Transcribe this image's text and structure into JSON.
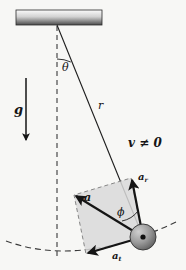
{
  "figure": {
    "labels": {
      "gravity": "g",
      "angle_theta": "θ",
      "radius": "r",
      "velocity_note": "v ≠ 0",
      "accel_radial": "a",
      "accel_radial_sub": "r",
      "accel_total": "a",
      "angle_phi": "ϕ",
      "accel_tangential": "a",
      "accel_tangential_sub": "t"
    },
    "colors": {
      "ink": "#151515",
      "ceiling_top": "#f2f2f2",
      "ceiling_bottom": "#4a4a4a",
      "parallelogram_fill": "#d9d9d9",
      "parallelogram_stroke": "#6e6e6e",
      "bob_light": "#bdbdbd",
      "bob_dark": "#6a6a6a",
      "dashed": "#3a3a3a",
      "background": "#f7f7f5"
    },
    "geometry": {
      "pivot": [
        57,
        25
      ],
      "bob_center": [
        143,
        237
      ],
      "bob_radius": 13,
      "ceiling": {
        "x": 16,
        "y": 10,
        "width": 86,
        "height": 15
      },
      "string_label_pos": [
        98,
        100
      ],
      "theta_arc_radius": 34,
      "phi_arc_radius": 26,
      "gravity_arrow": {
        "x": 26,
        "y1": 78,
        "y2": 142
      },
      "swing_arc": {
        "cx": 57,
        "cy": 25,
        "r": 219
      }
    }
  }
}
